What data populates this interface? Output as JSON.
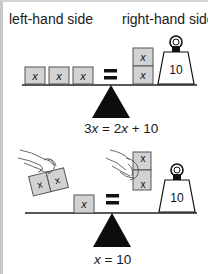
{
  "headers": {
    "left": "left-hand side",
    "right": "right-hand side"
  },
  "top_scale": {
    "left_blocks": [
      "x",
      "x",
      "x"
    ],
    "equals_sign": "=",
    "right_blocks": [
      "x",
      "x"
    ],
    "weight_label": "10",
    "equation_parts": [
      "3",
      "x",
      " = 2",
      "x",
      " + 10"
    ]
  },
  "bottom_scale": {
    "removed_left_blocks": [
      "x",
      "x"
    ],
    "removed_right_blocks": [
      "x",
      "x"
    ],
    "left_blocks": [
      "x"
    ],
    "equals_sign": "=",
    "weight_label": "10",
    "equation_parts": [
      "x",
      " = 10"
    ]
  },
  "colors": {
    "block_fill": "#d2d2d2",
    "block_stroke": "#555555",
    "ink": "#111111",
    "frame": "#c8c8c8"
  }
}
